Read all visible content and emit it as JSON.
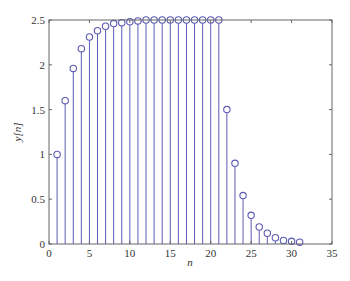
{
  "chart_data": {
    "type": "stem",
    "title": "",
    "xlabel": "n",
    "ylabel": "y[n]",
    "xlim": [
      0,
      35
    ],
    "ylim": [
      0,
      2.5
    ],
    "xticks": [
      0,
      5,
      10,
      15,
      20,
      25,
      30,
      35
    ],
    "yticks": [
      0,
      0.5,
      1,
      1.5,
      2,
      2.5
    ],
    "xtick_labels": [
      "0",
      "5",
      "10",
      "15",
      "20",
      "25",
      "30",
      "35"
    ],
    "ytick_labels": [
      "0",
      "0.5",
      "1",
      "1.5",
      "2",
      "2.5"
    ],
    "grid": false,
    "legend": null,
    "series": [
      {
        "name": "y[n]",
        "color": "#5b5bb5",
        "marker": "open-circle",
        "x": [
          1,
          2,
          3,
          4,
          5,
          6,
          7,
          8,
          9,
          10,
          11,
          12,
          13,
          14,
          15,
          16,
          17,
          18,
          19,
          20,
          21,
          22,
          23,
          24,
          25,
          26,
          27,
          28,
          29,
          30,
          31
        ],
        "values": [
          1.0,
          1.6,
          1.96,
          2.18,
          2.31,
          2.38,
          2.43,
          2.46,
          2.47,
          2.48,
          2.49,
          2.5,
          2.5,
          2.5,
          2.5,
          2.5,
          2.5,
          2.5,
          2.5,
          2.5,
          2.5,
          1.5,
          0.9,
          0.54,
          0.32,
          0.19,
          0.12,
          0.07,
          0.04,
          0.03,
          0.02
        ]
      }
    ]
  },
  "colors": {
    "stem": "#5b5bb5",
    "axes": "#666666",
    "text": "#333333",
    "background": "#ffffff"
  }
}
